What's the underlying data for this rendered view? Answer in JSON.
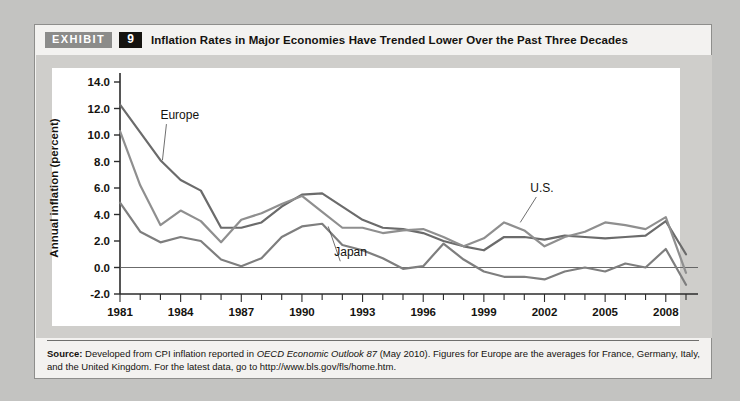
{
  "exhibit": {
    "tag": "EXHIBIT",
    "number": "9",
    "title": "Inflation Rates in Major Economies Have Trended Lower Over the Past Three Decades"
  },
  "source": {
    "label": "Source:",
    "text_before_italic": " Developed from CPI inflation reported in ",
    "italic": "OECD Economic Outlook 87",
    "text_after_italic": " (May 2010). Figures for Europe are the averages for France, Germany, Italy, and the United Kingdom. For the latest data, go to http://www.bls.gov/fls/home.htm."
  },
  "chart_data": {
    "type": "line",
    "title": "Inflation Rates in Major Economies Have Trended Lower Over the Past Three Decades",
    "xlabel": "",
    "ylabel": "Annual inflation (percent)",
    "xlim": [
      1981,
      2009
    ],
    "ylim": [
      -2.0,
      14.0
    ],
    "ytick_step": 2.0,
    "ytick_labels": [
      "14.0",
      "12.0",
      "10.0",
      "8.0",
      "6.0",
      "4.0",
      "2.0",
      "0.0",
      "-2.0"
    ],
    "ytick_values": [
      14.0,
      12.0,
      10.0,
      8.0,
      6.0,
      4.0,
      2.0,
      0.0,
      -2.0
    ],
    "xtick_labels": [
      "1981",
      "1984",
      "1987",
      "1990",
      "1993",
      "1996",
      "1999",
      "2002",
      "2005",
      "2008"
    ],
    "xtick_values": [
      1981,
      1984,
      1987,
      1990,
      1993,
      1996,
      1999,
      2002,
      2005,
      2008
    ],
    "xtick_minor_step": 1,
    "grid": false,
    "zero_line": true,
    "legend_position": "inline-annotations",
    "x": [
      1981,
      1982,
      1983,
      1984,
      1985,
      1986,
      1987,
      1988,
      1989,
      1990,
      1991,
      1992,
      1993,
      1994,
      1995,
      1996,
      1997,
      1998,
      1999,
      2000,
      2001,
      2002,
      2003,
      2004,
      2005,
      2006,
      2007,
      2008,
      2009
    ],
    "series": [
      {
        "name": "Europe",
        "color": "#6b6b6b",
        "values": [
          12.3,
          10.2,
          8.1,
          6.6,
          5.8,
          3.0,
          3.0,
          3.4,
          4.6,
          5.5,
          5.6,
          4.6,
          3.6,
          3.0,
          2.9,
          2.6,
          2.0,
          1.6,
          1.3,
          2.3,
          2.3,
          2.1,
          2.4,
          2.3,
          2.2,
          2.3,
          2.4,
          3.5,
          1.0
        ]
      },
      {
        "name": "U.S.",
        "color": "#8f8f8f",
        "values": [
          10.3,
          6.2,
          3.2,
          4.3,
          3.5,
          1.9,
          3.6,
          4.1,
          4.8,
          5.4,
          4.2,
          3.0,
          3.0,
          2.6,
          2.8,
          2.9,
          2.3,
          1.6,
          2.2,
          3.4,
          2.8,
          1.6,
          2.3,
          2.7,
          3.4,
          3.2,
          2.9,
          3.8,
          -0.4
        ]
      },
      {
        "name": "Japan",
        "color": "#7e7e7e",
        "values": [
          4.9,
          2.7,
          1.9,
          2.3,
          2.0,
          0.6,
          0.1,
          0.7,
          2.3,
          3.1,
          3.3,
          1.7,
          1.3,
          0.7,
          -0.1,
          0.1,
          1.8,
          0.6,
          -0.3,
          -0.7,
          -0.7,
          -0.9,
          -0.3,
          0.0,
          -0.3,
          0.3,
          0.0,
          1.4,
          -1.3
        ]
      }
    ],
    "annotations": [
      {
        "text": "Europe",
        "x": 1983.0,
        "y": 11.2,
        "leader_to_x": 1983.1,
        "leader_to_y": 8.1
      },
      {
        "text": "Japan",
        "x": 1991.6,
        "y": 0.85,
        "leader_to_x": 1991.3,
        "leader_to_y": 3.1
      },
      {
        "text": "U.S.",
        "x": 2001.3,
        "y": 5.7,
        "leader_to_x": 2000.8,
        "leader_to_y": 3.4
      }
    ]
  }
}
